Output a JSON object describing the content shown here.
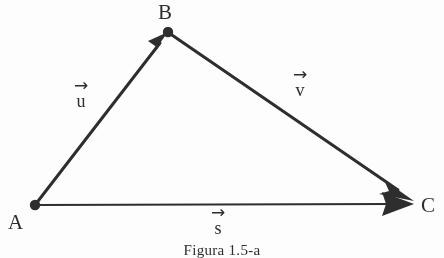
{
  "figure": {
    "caption": "Figura 1.5-a",
    "background_color": "#fdfdfd",
    "ink_color": "#2b2b2b",
    "width": 444,
    "height": 258
  },
  "vertices": [
    {
      "id": "A",
      "label": "A",
      "x": 35,
      "y": 205,
      "label_x": 8,
      "label_y": 212
    },
    {
      "id": "B",
      "label": "B",
      "x": 168,
      "y": 32,
      "label_x": 158,
      "label_y": 2
    },
    {
      "id": "C",
      "label": "C",
      "x": 412,
      "y": 203,
      "label_x": 421,
      "label_y": 195
    }
  ],
  "vectors": [
    {
      "id": "u",
      "name": "u",
      "arrow_glyph": "→",
      "from": "A",
      "to": "B",
      "label_x": 64,
      "label_y": 81,
      "stroke_width": 3
    },
    {
      "id": "v",
      "name": "v",
      "arrow_glyph": "→",
      "from": "B",
      "to": "C",
      "label_x": 283,
      "label_y": 70,
      "stroke_width": 3
    },
    {
      "id": "s",
      "name": "s",
      "arrow_glyph": "→",
      "from": "A",
      "to": "C",
      "label_x": 201,
      "label_y": 208,
      "stroke_width": 2
    }
  ],
  "caption_position": {
    "x": 0,
    "y": 242
  }
}
